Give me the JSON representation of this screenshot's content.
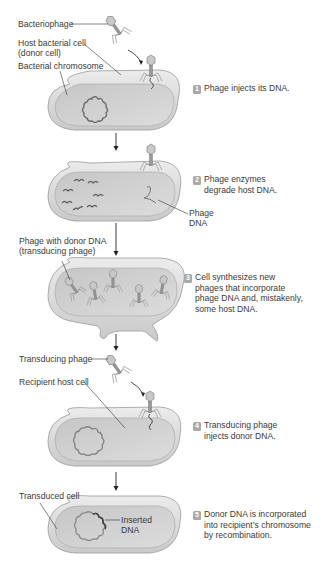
{
  "diagram": {
    "colors": {
      "cell_fill": "#d4d4d4",
      "cell_rim": "#e6e6e6",
      "cell_outline": "#9a9a9a",
      "dna": "#6e6e6e",
      "badge": "#a9a9a9",
      "text": "#3a3a3a"
    },
    "labels": {
      "bacteriophage": "Bacteriophage",
      "host_cell_line1": "Host bacterial cell",
      "host_cell_line2": "(donor cell)",
      "bacterial_chromosome": "Bacterial chromosome",
      "phage_dna_line1": "Phage",
      "phage_dna_line2": "DNA",
      "phage_donor_line1": "Phage with donor DNA",
      "phage_donor_line2": "(transducing phage)",
      "transducing_phage": "Transducing phage",
      "recipient_host_cell": "Recipient host cell",
      "transduced_cell": "Transduced cell",
      "inserted_dna_line1": "Inserted",
      "inserted_dna_line2": "DNA"
    },
    "steps": [
      {
        "number": "1",
        "lines": [
          "Phage injects its DNA."
        ]
      },
      {
        "number": "2",
        "lines": [
          "Phage enzymes",
          "degrade host DNA."
        ]
      },
      {
        "number": "3",
        "lines": [
          "Cell synthesizes new",
          "phages that incorporate",
          "phage DNA and, mistakenly,",
          "some host DNA."
        ]
      },
      {
        "number": "4",
        "lines": [
          "Transducing phage",
          "injects donor DNA."
        ]
      },
      {
        "number": "5",
        "lines": [
          "Donor DNA is incorporated",
          "into recipient’s chromosome",
          "by recombination."
        ]
      }
    ]
  }
}
